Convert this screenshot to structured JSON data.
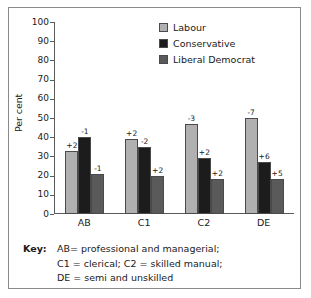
{
  "chart_data": {
    "type": "bar",
    "title": "",
    "xlabel": "",
    "ylabel": "Per cent",
    "ylim": [
      0,
      100
    ],
    "yticks": [
      0,
      10,
      20,
      30,
      40,
      50,
      60,
      70,
      80,
      90,
      100
    ],
    "grid": false,
    "legend_position": "top-right",
    "categories": [
      "AB",
      "C1",
      "C2",
      "DE"
    ],
    "series": [
      {
        "name": "Labour",
        "color": "#b0b0b0",
        "values": [
          33,
          39,
          47,
          50
        ],
        "annotations": [
          "+2",
          "+2",
          "-3",
          "-7"
        ]
      },
      {
        "name": "Conservative",
        "color": "#1c1c1c",
        "values": [
          40,
          35,
          29,
          27
        ],
        "annotations": [
          "-1",
          "-2",
          "+2",
          "+6"
        ]
      },
      {
        "name": "Liberal Democrat",
        "color": "#5a5a5a",
        "values": [
          21,
          20,
          18,
          18
        ],
        "annotations": [
          "-1",
          "+2",
          "+2",
          "+5"
        ]
      }
    ]
  },
  "key": {
    "word": "Key:",
    "lines": [
      "AB= professional and managerial;",
      "C1 = clerical; C2 = skilled manual;",
      "DE = semi and unskilled"
    ]
  }
}
